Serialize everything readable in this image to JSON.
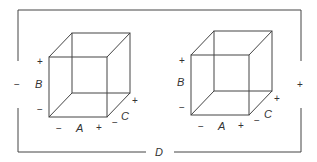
{
  "diagram": {
    "factor_d": {
      "label": "D",
      "low_sign": "−",
      "high_sign": "+"
    },
    "cubes": [
      {
        "id": "cube-d-low",
        "axes": {
          "A": {
            "label": "A",
            "low": "−",
            "high": "+"
          },
          "B": {
            "label": "B",
            "low": "−",
            "high": "+"
          },
          "C": {
            "label": "C",
            "low": "−",
            "high": "+"
          }
        }
      },
      {
        "id": "cube-d-high",
        "axes": {
          "A": {
            "label": "A",
            "low": "−",
            "high": "+"
          },
          "B": {
            "label": "B",
            "low": "−",
            "high": "+"
          },
          "C": {
            "label": "C",
            "low": "−",
            "high": "+"
          }
        }
      }
    ]
  }
}
